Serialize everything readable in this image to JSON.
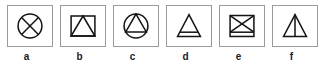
{
  "figure": {
    "type": "symbol-legend-strip",
    "background_color": "#ffffff",
    "box_border_color": "#9a9a9a",
    "glyph_color": "#141414",
    "label_color": "#1a1a1a",
    "panel_count": 6,
    "panels": [
      {
        "key": "a",
        "label": "a",
        "glyph_name": "circle-with-x-icon",
        "glyph_description": "Circle containing a diagonal cross (X) spanning the full circle",
        "outer_shape": "circle",
        "inner_marks": [
          "diagonal-line-nw-se",
          "diagonal-line-ne-sw"
        ]
      },
      {
        "key": "b",
        "label": "b",
        "glyph_name": "rectangle-with-triangle-icon",
        "glyph_description": "Rectangle containing an inscribed triangle whose apex touches the top edge and whose base rests on the bottom edge",
        "outer_shape": "rectangle",
        "inner_marks": [
          "triangle-inscribed"
        ]
      },
      {
        "key": "c",
        "label": "c",
        "glyph_name": "circle-with-triangle-icon",
        "glyph_description": "Circle containing an inscribed triangle with a horizontal base chord",
        "outer_shape": "circle",
        "inner_marks": [
          "triangle-inscribed"
        ]
      },
      {
        "key": "d",
        "label": "d",
        "glyph_name": "triangle-with-base-band-icon",
        "glyph_description": "Triangle crossed by a horizontal line near the bottom forming a narrow base band",
        "outer_shape": "triangle",
        "inner_marks": [
          "horizontal-line-near-base"
        ]
      },
      {
        "key": "e",
        "label": "e",
        "glyph_name": "rectangle-with-x-and-base-band-icon",
        "glyph_description": "Rectangle containing a diagonal cross (X) with a horizontal line near the bottom forming a base band",
        "outer_shape": "rectangle",
        "inner_marks": [
          "diagonal-line-nw-se",
          "diagonal-line-ne-sw",
          "horizontal-line-near-base"
        ]
      },
      {
        "key": "f",
        "label": "f",
        "glyph_name": "triangle-with-vertical-bisector-icon",
        "glyph_description": "Triangle with a vertical line from the apex down to the middle of the base",
        "outer_shape": "triangle",
        "inner_marks": [
          "vertical-line-apex-to-base"
        ]
      }
    ]
  }
}
